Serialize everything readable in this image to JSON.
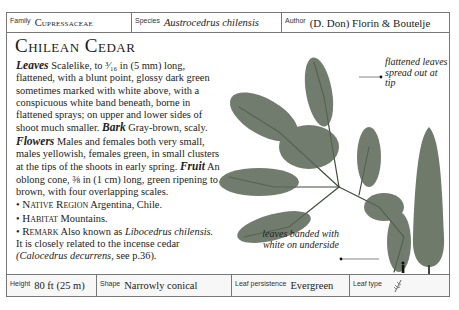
{
  "header": {
    "family_label": "Family",
    "family_value": "Cupressaceae",
    "species_label": "Species",
    "species_value": "Austrocedrus chilensis",
    "author_label": "Author",
    "author_value": "(D. Don) Florin & Boutelje"
  },
  "title": "Chilean Cedar",
  "description": {
    "leaves_label": "Leaves",
    "leaves_text": "Scalelike, to ³⁄₁₆ in (5 mm) long, flattened, with a blunt point, glossy dark green sometimes marked with white above, with a conspicuous white band beneath, borne in flattened sprays; on upper and lower sides of shoot much smaller.",
    "bark_label": "Bark",
    "bark_text": "Gray-brown, scaly.",
    "flowers_label": "Flowers",
    "flowers_text": "Males and females both very small, males yellowish, females green, in small clusters at the tips of the shoots in early spring.",
    "fruit_label": "Fruit",
    "fruit_text": "An oblong cone, ⅜ in (1 cm) long, green ripening to brown, with four overlapping scales."
  },
  "bullets": {
    "native_label": "Native Region",
    "native_text": "Argentina, Chile.",
    "habitat_label": "Habitat",
    "habitat_text": "Mountains.",
    "remark_label": "Remark",
    "remark_text_1": "Also known as",
    "remark_italic_1": "Libocedrus chilensis.",
    "remark_text_2": "It is closely related to the incense cedar",
    "remark_italic_2": "(Calocedrus decurrens,",
    "remark_text_3": "see p.36)."
  },
  "callouts": {
    "top": "flattened leaves spread out at tip",
    "bottom": "leaves banded with white on underside"
  },
  "footer": {
    "height_label": "Height",
    "height_value": "80 ft (25 m)",
    "shape_label": "Shape",
    "shape_value": "Narrowly conical",
    "persistence_label": "Leaf persistence",
    "persistence_value": "Evergreen",
    "leaftype_label": "Leaf type",
    "leaftype_icon": "scale-leaf-icon"
  },
  "colors": {
    "border": "#777777",
    "foliage": "#4d5a4a",
    "text": "#1a1a1a"
  }
}
